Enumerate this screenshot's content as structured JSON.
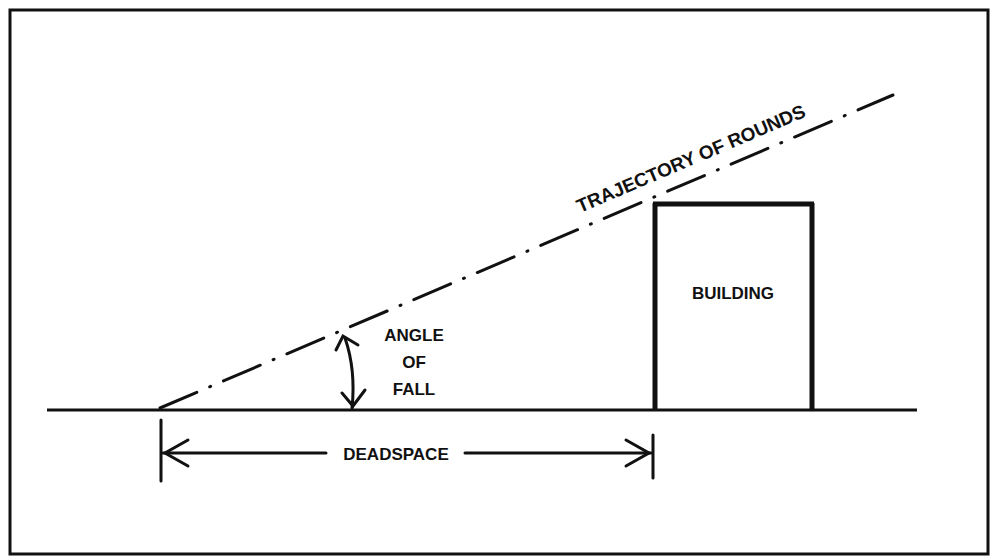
{
  "diagram": {
    "type": "deadspace-illustration",
    "colors": {
      "ink": "#111111",
      "background": "#ffffff"
    },
    "labels": {
      "trajectory": "TRAJECTORY OF ROUNDS",
      "building": "BUILDING",
      "angle_line1": "ANGLE",
      "angle_line2": "OF",
      "angle_line3": "FALL",
      "deadspace": "DEADSPACE"
    },
    "elements": {
      "frame": {
        "x": 10,
        "y": 10,
        "width": 978,
        "height": 544
      },
      "ground_line": {
        "x1": 47,
        "y1": 410,
        "x2": 917,
        "y2": 410
      },
      "trajectory_line": {
        "x1": 160,
        "y1": 408,
        "x2": 893,
        "y2": 95,
        "style": "dash-dot"
      },
      "building": {
        "x": 655,
        "y": 203,
        "width": 157,
        "height": 207
      },
      "deadspace_span": {
        "x1": 160,
        "x2": 655,
        "y": 453
      },
      "angle_arrow": {
        "x": 352,
        "y_top": 338,
        "y_bottom": 408
      }
    }
  }
}
